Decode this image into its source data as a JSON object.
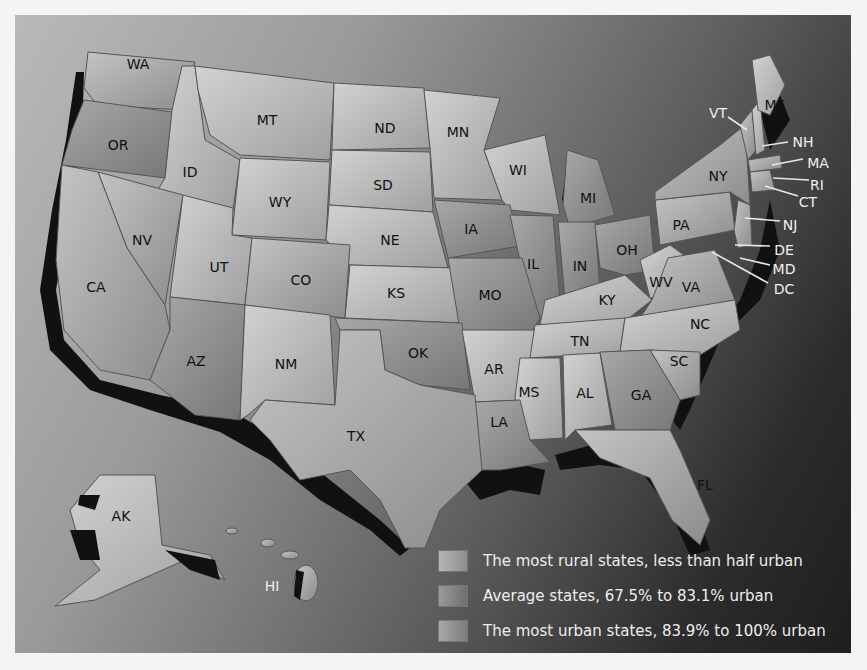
{
  "map": {
    "title": "",
    "states": [
      {
        "code": "WA",
        "x": 138,
        "y": 64
      },
      {
        "code": "OR",
        "x": 118,
        "y": 145
      },
      {
        "code": "ID",
        "x": 190,
        "y": 172
      },
      {
        "code": "MT",
        "x": 267,
        "y": 120
      },
      {
        "code": "WY",
        "x": 280,
        "y": 202
      },
      {
        "code": "ND",
        "x": 385,
        "y": 128
      },
      {
        "code": "SD",
        "x": 383,
        "y": 185
      },
      {
        "code": "NE",
        "x": 390,
        "y": 240
      },
      {
        "code": "MN",
        "x": 458,
        "y": 132
      },
      {
        "code": "WI",
        "x": 518,
        "y": 170
      },
      {
        "code": "MI",
        "x": 588,
        "y": 198
      },
      {
        "code": "IA",
        "x": 471,
        "y": 229
      },
      {
        "code": "IL",
        "x": 533,
        "y": 264
      },
      {
        "code": "IN",
        "x": 580,
        "y": 266
      },
      {
        "code": "OH",
        "x": 627,
        "y": 250
      },
      {
        "code": "NV",
        "x": 142,
        "y": 240
      },
      {
        "code": "UT",
        "x": 219,
        "y": 267
      },
      {
        "code": "CO",
        "x": 301,
        "y": 280
      },
      {
        "code": "KS",
        "x": 396,
        "y": 293
      },
      {
        "code": "MO",
        "x": 490,
        "y": 295
      },
      {
        "code": "KY",
        "x": 607,
        "y": 300
      },
      {
        "code": "WV",
        "x": 661,
        "y": 282
      },
      {
        "code": "VA",
        "x": 691,
        "y": 287
      },
      {
        "code": "PA",
        "x": 681,
        "y": 225
      },
      {
        "code": "NY",
        "x": 718,
        "y": 176
      },
      {
        "code": "CA",
        "x": 96,
        "y": 287
      },
      {
        "code": "AZ",
        "x": 196,
        "y": 361
      },
      {
        "code": "NM",
        "x": 286,
        "y": 364
      },
      {
        "code": "OK",
        "x": 418,
        "y": 353
      },
      {
        "code": "AR",
        "x": 494,
        "y": 369
      },
      {
        "code": "TN",
        "x": 580,
        "y": 341
      },
      {
        "code": "NC",
        "x": 700,
        "y": 324
      },
      {
        "code": "SC",
        "x": 679,
        "y": 361
      },
      {
        "code": "MS",
        "x": 529,
        "y": 392
      },
      {
        "code": "AL",
        "x": 585,
        "y": 393
      },
      {
        "code": "GA",
        "x": 641,
        "y": 395
      },
      {
        "code": "LA",
        "x": 499,
        "y": 422
      },
      {
        "code": "TX",
        "x": 356,
        "y": 436
      },
      {
        "code": "FL",
        "x": 705,
        "y": 485
      },
      {
        "code": "AK",
        "x": 121,
        "y": 516
      }
    ],
    "callouts": [
      {
        "code": "ME",
        "x": 775,
        "y": 105,
        "color": "dark"
      },
      {
        "code": "VT",
        "x": 718,
        "y": 113,
        "color": "light"
      },
      {
        "code": "NH",
        "x": 803,
        "y": 142,
        "color": "light"
      },
      {
        "code": "MA",
        "x": 818,
        "y": 163,
        "color": "light"
      },
      {
        "code": "RI",
        "x": 817,
        "y": 185,
        "color": "light"
      },
      {
        "code": "CT",
        "x": 808,
        "y": 202,
        "color": "light"
      },
      {
        "code": "NJ",
        "x": 790,
        "y": 225,
        "color": "light"
      },
      {
        "code": "DE",
        "x": 784,
        "y": 250,
        "color": "light"
      },
      {
        "code": "MD",
        "x": 784,
        "y": 269,
        "color": "light"
      },
      {
        "code": "DC",
        "x": 784,
        "y": 289,
        "color": "light"
      },
      {
        "code": "HI",
        "x": 272,
        "y": 586,
        "color": "light"
      }
    ]
  },
  "legend": {
    "items": [
      {
        "label": "The most rural states, less than half urban",
        "swatch": "#a7a7a7"
      },
      {
        "label": "Average states, 67.5% to 83.1% urban",
        "swatch": "#8e8e8e"
      },
      {
        "label": "The most urban states, 83.9% to 100% urban",
        "swatch": "#9b9b9b"
      }
    ]
  },
  "colors": {
    "rural": "#b8b8b8",
    "average": "#8f8f8f",
    "urban": "#a5a5a5",
    "coast_shadow": "#111111"
  }
}
